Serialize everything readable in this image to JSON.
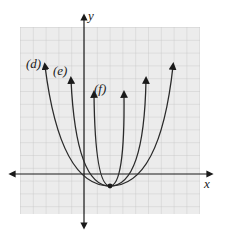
{
  "figure": {
    "axes": {
      "x_label": "x",
      "y_label": "y"
    },
    "curves": [
      {
        "label": "(d)",
        "name": "d"
      },
      {
        "label": "(e)",
        "name": "e"
      },
      {
        "label": "(f)",
        "name": "f"
      }
    ],
    "vertex": {
      "x": 2,
      "y": -1
    },
    "colors": {
      "grid": "#c8c8c8",
      "grid_bg": "#ececec",
      "curve": "#2a2a2a",
      "axis": "#1a1a1a"
    }
  }
}
